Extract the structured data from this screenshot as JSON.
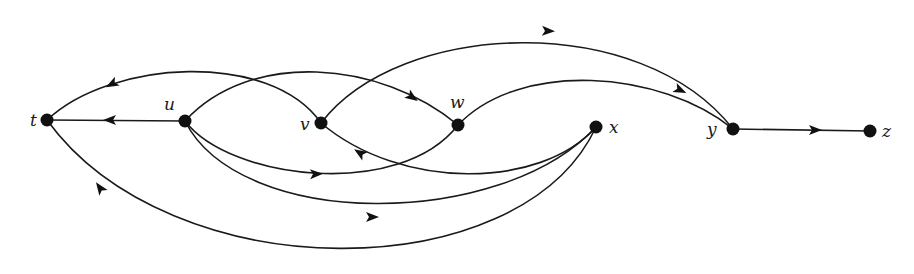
{
  "diagram": {
    "type": "directed-graph",
    "nodes": [
      {
        "id": "t",
        "label": "t",
        "x": 47,
        "y": 120,
        "lx": 30,
        "ly": 126
      },
      {
        "id": "u",
        "label": "u",
        "x": 185,
        "y": 121,
        "lx": 164,
        "ly": 110
      },
      {
        "id": "v",
        "label": "v",
        "x": 321,
        "y": 123,
        "lx": 300,
        "ly": 130
      },
      {
        "id": "w",
        "label": "w",
        "x": 458,
        "y": 125,
        "lx": 450,
        "ly": 108
      },
      {
        "id": "x",
        "label": "x",
        "x": 596,
        "y": 127,
        "lx": 609,
        "ly": 133
      },
      {
        "id": "y",
        "label": "y",
        "x": 733,
        "y": 129,
        "lx": 707,
        "ly": 135
      },
      {
        "id": "z",
        "label": "z",
        "x": 870,
        "y": 131,
        "lx": 882,
        "ly": 137
      }
    ],
    "edges": [
      {
        "from": "u",
        "to": "t",
        "path": "M185,121 L47,120",
        "arrow": {
          "x": 110,
          "y": 120,
          "angle": 180
        }
      },
      {
        "from": "v",
        "to": "t",
        "path": "M321,123 C270,50 110,60 47,120",
        "arrow": {
          "x": 112,
          "y": 84,
          "angle": 152
        }
      },
      {
        "from": "u",
        "to": "w",
        "path": "M185,121 C250,50 380,60 458,125",
        "arrow": {
          "x": 412,
          "y": 97,
          "angle": 35
        }
      },
      {
        "from": "u",
        "to": "w",
        "path": "M185,121 C230,180 400,200 458,125",
        "arrow": {
          "x": 316,
          "y": 174,
          "angle": -2
        }
      },
      {
        "from": "v",
        "to": "y",
        "path": "M321,123 C400,20 640,10 733,129",
        "arrow": {
          "x": 548,
          "y": 31,
          "angle": 2
        }
      },
      {
        "from": "w",
        "to": "y",
        "path": "M458,125 C520,60 660,70 733,129",
        "arrow": {
          "x": 680,
          "y": 90,
          "angle": 25
        }
      },
      {
        "from": "x",
        "to": "v",
        "path": "M596,127 C540,190 400,190 321,123",
        "arrow": {
          "x": 360,
          "y": 153,
          "angle": 213
        }
      },
      {
        "from": "u",
        "to": "x",
        "path": "M185,121 C240,230 500,230 596,127",
        "arrow": {
          "x": 372,
          "y": 217,
          "angle": 0
        }
      },
      {
        "from": "x",
        "to": "t",
        "path": "M596,127 C520,290 170,290 47,120",
        "arrow": {
          "x": 100,
          "y": 188,
          "angle": 235
        }
      },
      {
        "from": "y",
        "to": "z",
        "path": "M733,129 L870,131",
        "arrow": {
          "x": 815,
          "y": 130,
          "angle": 0
        }
      }
    ]
  }
}
